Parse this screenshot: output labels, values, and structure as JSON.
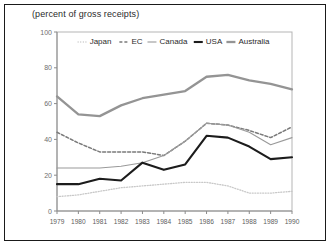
{
  "figure": {
    "title": "(percent of gross receipts)",
    "background_color": "#ffffff",
    "border_color": "#1a1a1a"
  },
  "chart_data": {
    "type": "line",
    "title": "(percent of gross receipts)",
    "xlabel": "",
    "ylabel": "",
    "categories": [
      "1979",
      "1980",
      "1981",
      "1982",
      "1983",
      "1984",
      "1985",
      "1986",
      "1987",
      "1988",
      "1989",
      "1990"
    ],
    "x": [
      1979,
      1980,
      1981,
      1982,
      1983,
      1984,
      1985,
      1986,
      1987,
      1988,
      1989,
      1990
    ],
    "xlim": [
      1979,
      1990
    ],
    "ylim": [
      0,
      100
    ],
    "yticks": [
      0,
      20,
      40,
      60,
      80,
      100
    ],
    "ytick_labels": [
      "0",
      "20",
      "40",
      "60",
      "80",
      "100"
    ],
    "xtick_labels": [
      "1979",
      "1980",
      "1981",
      "1982",
      "1983",
      "1984",
      "1985",
      "1986",
      "1987",
      "1988",
      "1989",
      "1990"
    ],
    "grid": false,
    "legend_position": "top-inside",
    "series": [
      {
        "name": "Japan",
        "label": "Japan",
        "color": "#c8c8c8",
        "style": "dotted",
        "width": 1.3,
        "dash": "1,1.6",
        "values": [
          8,
          9,
          11,
          13,
          14,
          15,
          16,
          16,
          14,
          10,
          10,
          11
        ]
      },
      {
        "name": "EC",
        "label": "EC",
        "color": "#7a7a7a",
        "style": "dashed",
        "width": 1.5,
        "dash": "3,2",
        "values": [
          44,
          38,
          33,
          33,
          33,
          31,
          39,
          49,
          48,
          45,
          41,
          47
        ]
      },
      {
        "name": "Canada",
        "label": "Canada",
        "color": "#9a9a9a",
        "style": "solid",
        "width": 1.1,
        "dash": "none",
        "values": [
          24,
          24,
          24,
          25,
          27,
          31,
          39,
          49,
          48,
          44,
          37,
          41
        ]
      },
      {
        "name": "USA",
        "label": "USA",
        "color": "#1c1c1c",
        "style": "solid",
        "width": 2.1,
        "dash": "none",
        "values": [
          15,
          15,
          18,
          17,
          27,
          23,
          26,
          42,
          41,
          36,
          29,
          30
        ]
      },
      {
        "name": "Australia",
        "label": "Australia",
        "color": "#949494",
        "style": "solid",
        "width": 2.3,
        "dash": "none",
        "values": [
          64,
          54,
          53,
          59,
          63,
          65,
          67,
          75,
          76,
          73,
          71,
          68
        ]
      }
    ],
    "legend_entries": [
      {
        "label": "Japan",
        "color": "#c8c8c8",
        "dash": "1,1.6",
        "width": 1.3
      },
      {
        "label": "EC",
        "color": "#7a7a7a",
        "dash": "3,2",
        "width": 1.5
      },
      {
        "label": "Canada",
        "color": "#9a9a9a",
        "dash": "none",
        "width": 1.1
      },
      {
        "label": "USA",
        "color": "#1c1c1c",
        "dash": "none",
        "width": 2.1
      },
      {
        "label": "Australia",
        "color": "#949494",
        "dash": "none",
        "width": 2.3
      }
    ]
  }
}
